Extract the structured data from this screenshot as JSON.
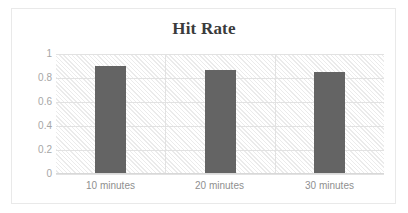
{
  "chart_data": {
    "type": "bar",
    "title": "Hit Rate",
    "xlabel": "",
    "ylabel": "",
    "categories": [
      "10 minutes",
      "20 minutes",
      "30 minutes"
    ],
    "values": [
      0.9,
      0.865,
      0.85
    ],
    "series": [
      {
        "name": "Hit Rate",
        "values": [
          0.9,
          0.865,
          0.85
        ]
      }
    ],
    "ylim": [
      0,
      1
    ],
    "ytick_labels": [
      "1",
      "0.8",
      "0.6",
      "0.4",
      "0.2",
      "0"
    ],
    "ytick_values": [
      1,
      0.8,
      0.6,
      0.4,
      0.2,
      0
    ],
    "grid": true,
    "grid_horizontal": true,
    "grid_vertical": true,
    "legend": false,
    "legend_position": "none",
    "colors": {
      "bar": "#646464",
      "title": "#3b3b3b",
      "ytick_label": "#a6a6a6",
      "xtick_label": "#8f8f8f",
      "gridline": "#e2e2e2",
      "plot_background": "#ffffff",
      "plot_hatch": "#ebebeb",
      "frame_border": "#e9e9e9"
    }
  }
}
